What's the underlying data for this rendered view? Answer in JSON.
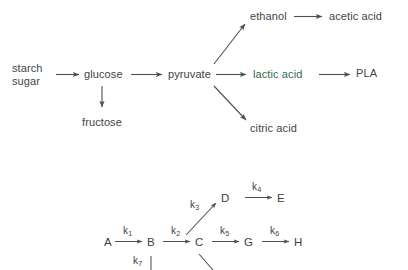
{
  "figure": {
    "background_color": "#ffffff",
    "text_color": "#3f4449",
    "accent_color": "#2f6b4f",
    "arrow_color": "#4a4f55"
  },
  "pathway_diagram": {
    "name": "fermentation-pathway",
    "nodes": {
      "starch_sugar_line1": "starch",
      "starch_sugar_line2": "sugar",
      "glucose": "glucose",
      "fructose": "fructose",
      "pyruvate": "pyruvate",
      "ethanol": "ethanol",
      "acetic_acid": "acetic acid",
      "lactic_acid": "lactic acid",
      "pla": "PLA",
      "citric_acid": "citric acid"
    },
    "edges": [
      {
        "from": "starch sugar",
        "to": "glucose",
        "style": "horizontal-arrow"
      },
      {
        "from": "glucose",
        "to": "pyruvate",
        "style": "horizontal-arrow"
      },
      {
        "from": "glucose",
        "to": "fructose",
        "style": "vertical-arrow-down"
      },
      {
        "from": "pyruvate",
        "to": "ethanol",
        "style": "diagonal-arrow-up"
      },
      {
        "from": "ethanol",
        "to": "acetic acid",
        "style": "horizontal-arrow"
      },
      {
        "from": "pyruvate",
        "to": "lactic acid",
        "style": "horizontal-arrow"
      },
      {
        "from": "lactic acid",
        "to": "PLA",
        "style": "horizontal-arrow"
      },
      {
        "from": "pyruvate",
        "to": "citric acid",
        "style": "diagonal-arrow-down"
      }
    ]
  },
  "kinetics_diagram": {
    "name": "reaction-scheme",
    "species": {
      "a": "A",
      "b": "B",
      "c": "C",
      "d": "D",
      "e": "E",
      "g": "G",
      "h": "H"
    },
    "rate_constants": {
      "k1": "k",
      "k1_sub": "1",
      "k2": "k",
      "k2_sub": "2",
      "k3": "k",
      "k3_sub": "3",
      "k4": "k",
      "k4_sub": "4",
      "k5": "k",
      "k5_sub": "5",
      "k6": "k",
      "k6_sub": "6",
      "k7": "k",
      "k7_sub": "7"
    },
    "edges": [
      {
        "from": "A",
        "to": "B",
        "rate": "k1",
        "style": "horizontal-arrow"
      },
      {
        "from": "B",
        "to": "C",
        "rate": "k2",
        "style": "horizontal-arrow"
      },
      {
        "from": "C",
        "to": "D",
        "rate": "k3",
        "style": "diagonal-arrow-up"
      },
      {
        "from": "D",
        "to": "E",
        "rate": "k4",
        "style": "horizontal-arrow"
      },
      {
        "from": "C",
        "to": "G",
        "rate": "k5",
        "style": "horizontal-arrow"
      },
      {
        "from": "G",
        "to": "H",
        "rate": "k6",
        "style": "horizontal-arrow"
      },
      {
        "from": "B",
        "to": "",
        "rate": "k7",
        "style": "vertical-line-down-clipped"
      },
      {
        "from": "C",
        "to": "",
        "rate": "",
        "style": "diagonal-line-down-clipped"
      }
    ]
  }
}
